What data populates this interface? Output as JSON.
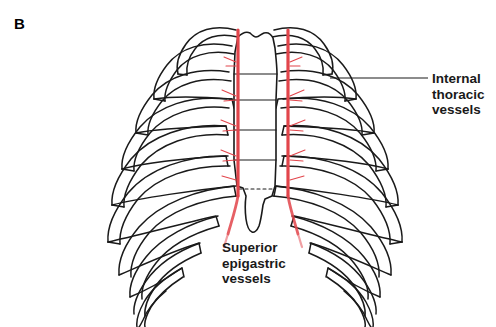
{
  "figure": {
    "panel_label": "B",
    "background_color": "#ffffff",
    "bone_outline_color": "#1a1a1a",
    "vessel_color": "#e2454b",
    "text_color": "#1a1a1a"
  },
  "labels": {
    "internal_thoracic": {
      "text": "Internal\nthoracic\nvessels",
      "leader_line": true
    },
    "superior_epigastric": {
      "text": "Superior\nepigastric\nvessels",
      "leader_line": false
    }
  },
  "anatomy": {
    "structure": "anterior thoracic cage",
    "parts": [
      "manubrium",
      "sternum body",
      "xiphoid process",
      "ribs",
      "costal cartilages",
      "costal margin"
    ],
    "vessels": [
      "left internal thoracic vessels",
      "right internal thoracic vessels",
      "left superior epigastric vessels",
      "right superior epigastric vessels"
    ],
    "rib_pairs": 11
  }
}
